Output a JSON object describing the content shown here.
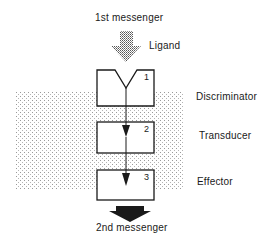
{
  "diagram": {
    "input_label": "1st messenger",
    "ligand_label": "Ligand",
    "output_label": "2nd messenger",
    "membrane_pattern": "stippled",
    "components": [
      {
        "number": "1",
        "label": "Discriminator"
      },
      {
        "number": "2",
        "label": "Transducer"
      },
      {
        "number": "3",
        "label": "Effector"
      }
    ],
    "colors": {
      "line": "#1a1a1a",
      "stipple": "#9a9a9a",
      "background": "#ffffff"
    }
  }
}
